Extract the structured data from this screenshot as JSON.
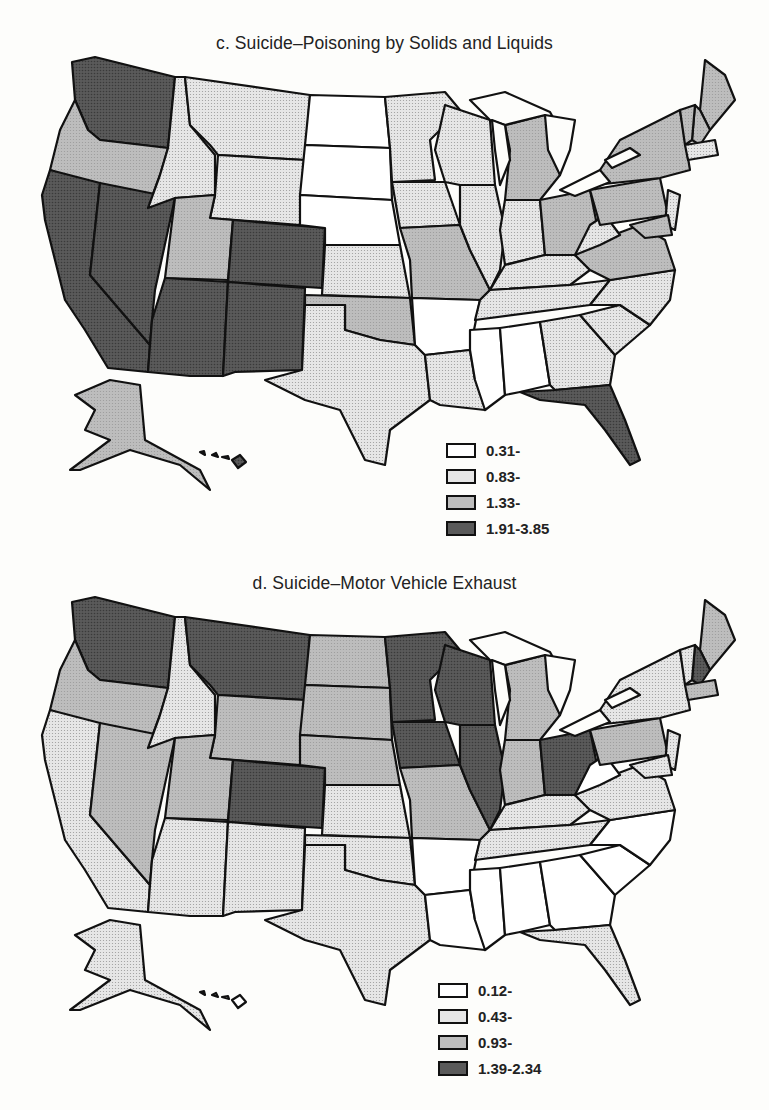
{
  "maps": [
    {
      "id": "c",
      "title": "c. Suicide–Poisoning by Solids and Liquids",
      "legend": [
        {
          "label": "0.31-",
          "class": 1
        },
        {
          "label": "0.83-",
          "class": 2
        },
        {
          "label": "1.33-",
          "class": 3
        },
        {
          "label": "1.91-3.85",
          "class": 4
        }
      ],
      "state_classes": {
        "WA": 4,
        "OR": 3,
        "CA": 4,
        "NV": 4,
        "ID": 2,
        "MT": 2,
        "WY": 2,
        "UT": 3,
        "AZ": 4,
        "CO": 4,
        "NM": 4,
        "ND": 1,
        "SD": 1,
        "NE": 1,
        "KS": 2,
        "OK": 3,
        "TX": 2,
        "MN": 2,
        "IA": 2,
        "MO": 3,
        "AR": 1,
        "LA": 2,
        "WI": 2,
        "IL": 2,
        "MI": 3,
        "IN": 2,
        "OH": 3,
        "KY": 2,
        "TN": 2,
        "MS": 1,
        "AL": 1,
        "GA": 2,
        "FL": 4,
        "SC": 2,
        "NC": 2,
        "VA": 3,
        "WV": 2,
        "PA": 3,
        "NY": 3,
        "ME": 3,
        "NH": 3,
        "VT": 3,
        "MA": 2,
        "NJ": 2,
        "MD": 3,
        "AK": 3,
        "HI": 4
      }
    },
    {
      "id": "d",
      "title": "d. Suicide–Motor Vehicle Exhaust",
      "legend": [
        {
          "label": "0.12-",
          "class": 1
        },
        {
          "label": "0.43-",
          "class": 2
        },
        {
          "label": "0.93-",
          "class": 3
        },
        {
          "label": "1.39-2.34",
          "class": 4
        }
      ],
      "state_classes": {
        "WA": 4,
        "OR": 3,
        "CA": 2,
        "NV": 3,
        "ID": 2,
        "MT": 4,
        "WY": 3,
        "UT": 3,
        "AZ": 2,
        "CO": 4,
        "NM": 2,
        "ND": 3,
        "SD": 3,
        "NE": 3,
        "KS": 2,
        "OK": 2,
        "TX": 2,
        "MN": 4,
        "IA": 4,
        "MO": 3,
        "AR": 1,
        "LA": 1,
        "WI": 4,
        "IL": 4,
        "MI": 3,
        "IN": 3,
        "OH": 4,
        "KY": 2,
        "TN": 2,
        "MS": 1,
        "AL": 1,
        "GA": 1,
        "FL": 2,
        "SC": 1,
        "NC": 1,
        "VA": 2,
        "WV": 1,
        "PA": 3,
        "NY": 2,
        "ME": 3,
        "NH": 4,
        "VT": 2,
        "MA": 3,
        "NJ": 2,
        "MD": 2,
        "AK": 2,
        "HI": 1
      }
    }
  ],
  "colors": {
    "class1": "#ffffff",
    "class2": "#e6e6e6",
    "class3": "#bdbdbd",
    "class4": "#5a5a5a",
    "stroke": "#111111"
  }
}
